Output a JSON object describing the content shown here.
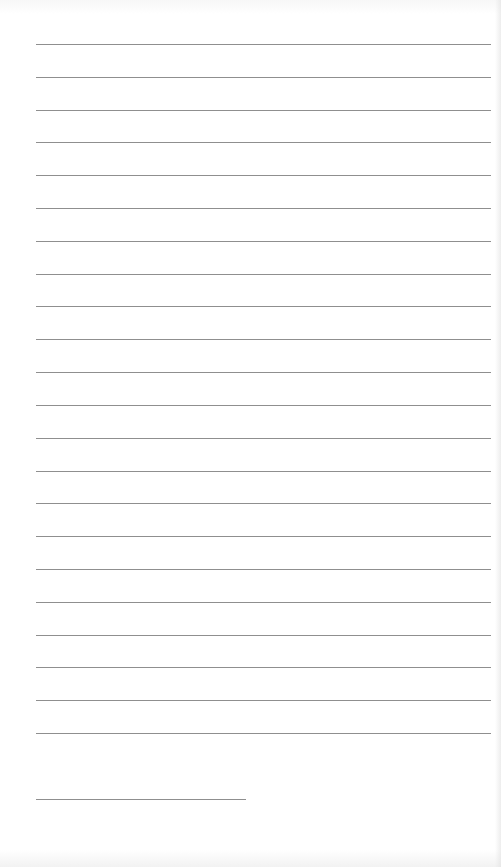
{
  "document": {
    "type": "blank ruled page",
    "ruled_line_count": 22,
    "ruled_line_color": "#8f8f8f",
    "background_color": "#ffffff",
    "has_footnote_rule": true,
    "text_content": ""
  }
}
